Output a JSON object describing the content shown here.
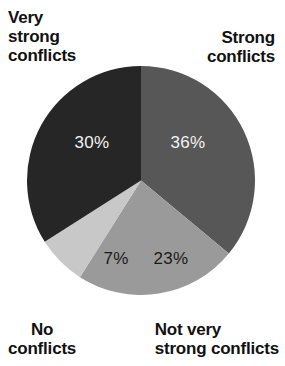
{
  "chart_data": {
    "type": "pie",
    "title": "",
    "legend_position": "around-chart",
    "total": 96,
    "slices": [
      {
        "label": "Strong\nconflicts",
        "label_plain": "Strong conflicts",
        "value": 36,
        "value_label": "36%",
        "color": "#575757",
        "value_text_color": "#f2f2f2",
        "start_angle": 0,
        "end_angle": 129.6
      },
      {
        "label": "Not very\nstrong conflicts",
        "label_plain": "Not very strong conflicts",
        "value": 23,
        "value_label": "23%",
        "color": "#9a9a9a",
        "value_text_color": "#1a1a1a",
        "start_angle": 129.6,
        "end_angle": 212.4
      },
      {
        "label": "No\nconflicts",
        "label_plain": "No conflicts",
        "value": 7,
        "value_label": "7%",
        "color": "#c8c8c8",
        "value_text_color": "#1a1a1a",
        "start_angle": 212.4,
        "end_angle": 237.6
      },
      {
        "label": "Very\nstrong\nconflicts",
        "label_plain": "Very strong conflicts",
        "value": 30,
        "value_label": "30%",
        "color": "#262626",
        "value_text_color": "#f2f2f2",
        "start_angle": 237.6,
        "end_angle": 360
      }
    ],
    "background_color": "#ffffff",
    "label_text_color": "#111111"
  },
  "labels": {
    "very_strong": "Very\nstrong\nconflicts",
    "strong": "Strong\nconflicts",
    "no_conflicts": "No\nconflicts",
    "not_very_strong": "Not very\nstrong conflicts"
  },
  "values": {
    "strong": "36%",
    "not_very_strong": "23%",
    "no_conflicts": "7%",
    "very_strong": "30%"
  }
}
